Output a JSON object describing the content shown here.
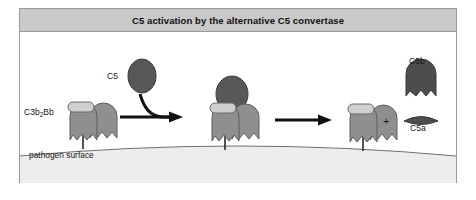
{
  "figure": {
    "title": "C5 activation by the alternative C5 convertase",
    "surface_label": "pathogen surface",
    "plus_sign": "+",
    "labels": {
      "convertase": "C3b",
      "convertase_sub": "2",
      "convertase_tail": "Bb",
      "c5": "C5",
      "c5b": "C5b",
      "c5a": "C5a"
    },
    "colors": {
      "frame_border": "#9a9a9a",
      "title_band": "#c9c9c9",
      "canvas": "#ffffff",
      "surface_fill": "#ededed",
      "surface_line": "#6f6f6f",
      "c3b_fill": "#8f8f8f",
      "c3b_stroke": "#5f5f5f",
      "bb_fill": "#cfcfcf",
      "bb_stroke": "#6b6b6b",
      "c5_fill": "#585858",
      "c5_stroke": "#3a3a3a",
      "c5b_fill": "#4d4d4d",
      "c5a_fill": "#4d4d4d",
      "arrow": "#111111",
      "stem": "#2a2a2a",
      "text": "#1b1b1b"
    },
    "stages": [
      {
        "name": "alternative-c5-convertase-on-surface",
        "label": "C3b2Bb",
        "components": [
          "Bb-rectangle",
          "C3b-dome-left",
          "C3b-dome-right",
          "membrane-stem"
        ]
      },
      {
        "name": "c5-bound-to-convertase",
        "components": [
          "C5-ellipse",
          "Bb-rectangle",
          "C3b-dome-left",
          "C3b-dome-right",
          "membrane-stem"
        ]
      },
      {
        "name": "convertase-after-cleavage",
        "components": [
          "Bb-rectangle",
          "C3b-dome-left",
          "C3b-dome-right",
          "membrane-stem"
        ]
      },
      {
        "name": "cleavage-products",
        "components": [
          "C5b-dome",
          "C5a-lens"
        ]
      }
    ],
    "arrows": [
      {
        "name": "c5-binding-arrow",
        "style": "curved-hook",
        "direction": "right"
      },
      {
        "name": "cleavage-arrow",
        "style": "straight",
        "direction": "right"
      }
    ]
  }
}
